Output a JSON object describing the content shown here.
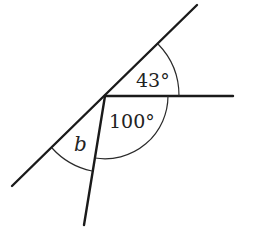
{
  "diagram": {
    "type": "angle-diagram",
    "labels": {
      "angle_top": "43°",
      "angle_lower": "100°",
      "angle_unknown": "b"
    },
    "angles": [
      {
        "id": "top",
        "value_deg": 43,
        "between": [
          "horizontal-ray",
          "diagonal-line-upper"
        ]
      },
      {
        "id": "lower",
        "value_deg": 100,
        "between": [
          "horizontal-ray",
          "lower-ray"
        ]
      },
      {
        "id": "unknown",
        "symbol": "b",
        "between": [
          "lower-ray",
          "diagonal-line-lower"
        ]
      }
    ],
    "colors": {
      "line": "#1a1a1a",
      "background": "#ffffff"
    }
  }
}
